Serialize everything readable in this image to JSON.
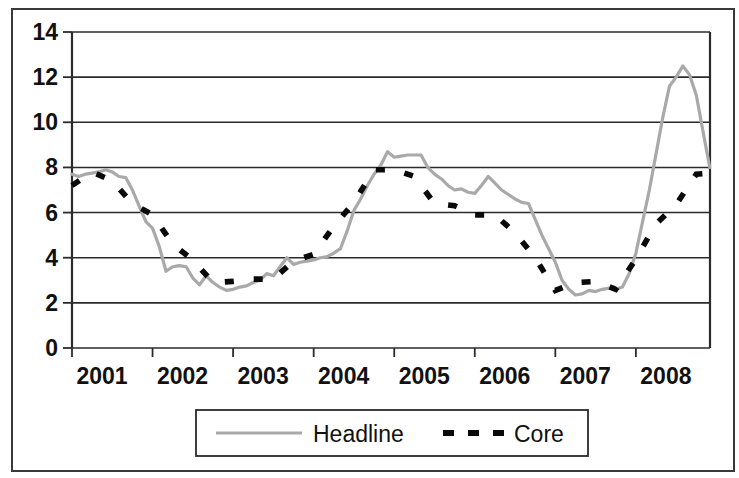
{
  "chart_data": {
    "type": "line",
    "title": "",
    "subtitle": "",
    "xlabel": "",
    "ylabel": "",
    "xlim": [
      2001,
      2008.92
    ],
    "ylim": [
      0,
      14
    ],
    "ytick_values": [
      0,
      2,
      4,
      6,
      8,
      10,
      12,
      14
    ],
    "ytick_labels": [
      "0",
      "2",
      "4",
      "6",
      "8",
      "10",
      "12",
      "14"
    ],
    "xtick_values": [
      2001,
      2002,
      2003,
      2004,
      2005,
      2006,
      2007,
      2008
    ],
    "xtick_labels": [
      "2001",
      "2002",
      "2003",
      "2004",
      "2005",
      "2006",
      "2007",
      "2008"
    ],
    "grid": "horizontal",
    "legend_position": "bottom-center",
    "colors": {
      "headline": "#a9a9a9",
      "core": "#0a0a0a",
      "axis": "#2b2b2b",
      "frame": "#3a3a3a",
      "background": "#ffffff"
    },
    "series": [
      {
        "name": "Headline",
        "style": "solid",
        "color": "#a9a9a9",
        "x": [
          2001.0,
          2001.083,
          2001.167,
          2001.25,
          2001.333,
          2001.417,
          2001.5,
          2001.583,
          2001.667,
          2001.75,
          2001.833,
          2001.917,
          2002.0,
          2002.083,
          2002.167,
          2002.25,
          2002.333,
          2002.417,
          2002.5,
          2002.583,
          2002.667,
          2002.75,
          2002.833,
          2002.917,
          2003.0,
          2003.083,
          2003.167,
          2003.25,
          2003.333,
          2003.417,
          2003.5,
          2003.583,
          2003.667,
          2003.75,
          2003.833,
          2003.917,
          2004.0,
          2004.083,
          2004.167,
          2004.25,
          2004.333,
          2004.417,
          2004.5,
          2004.583,
          2004.667,
          2004.75,
          2004.833,
          2004.917,
          2005.0,
          2005.083,
          2005.167,
          2005.25,
          2005.333,
          2005.417,
          2005.5,
          2005.583,
          2005.667,
          2005.75,
          2005.833,
          2005.917,
          2006.0,
          2006.083,
          2006.167,
          2006.25,
          2006.333,
          2006.417,
          2006.5,
          2006.583,
          2006.667,
          2006.75,
          2006.833,
          2006.917,
          2007.0,
          2007.083,
          2007.167,
          2007.25,
          2007.333,
          2007.417,
          2007.5,
          2007.583,
          2007.667,
          2007.75,
          2007.833,
          2007.917,
          2008.0,
          2008.083,
          2008.167,
          2008.25,
          2008.333,
          2008.417,
          2008.5,
          2008.583,
          2008.667,
          2008.75,
          2008.833,
          2008.917
        ],
        "values": [
          7.7,
          7.6,
          7.7,
          7.75,
          7.8,
          7.9,
          7.8,
          7.6,
          7.55,
          7.0,
          6.3,
          5.6,
          5.3,
          4.5,
          3.4,
          3.6,
          3.65,
          3.6,
          3.1,
          2.8,
          3.2,
          2.9,
          2.7,
          2.55,
          2.6,
          2.7,
          2.75,
          2.9,
          3.0,
          3.3,
          3.2,
          3.6,
          4.0,
          3.7,
          3.8,
          3.85,
          3.9,
          4.0,
          4.05,
          4.2,
          4.4,
          5.2,
          6.1,
          6.6,
          7.2,
          7.7,
          8.1,
          8.7,
          8.45,
          8.5,
          8.55,
          8.55,
          8.55,
          8.0,
          7.7,
          7.5,
          7.2,
          7.0,
          7.05,
          6.9,
          6.85,
          7.2,
          7.6,
          7.3,
          7.0,
          6.8,
          6.6,
          6.45,
          6.4,
          5.7,
          5.0,
          4.4,
          3.8,
          3.0,
          2.6,
          2.35,
          2.4,
          2.55,
          2.5,
          2.6,
          2.65,
          2.6,
          2.7,
          3.3,
          4.2,
          5.6,
          7.0,
          8.6,
          10.2,
          11.6,
          12.0,
          12.5,
          12.1,
          11.2,
          9.6,
          8.0
        ]
      },
      {
        "name": "Core",
        "style": "dashed",
        "color": "#0a0a0a",
        "x": [
          2001.0,
          2001.25,
          2001.5,
          2001.75,
          2002.0,
          2002.25,
          2002.5,
          2002.75,
          2003.0,
          2003.25,
          2003.5,
          2003.75,
          2004.0,
          2004.25,
          2004.5,
          2004.75,
          2005.0,
          2005.25,
          2005.5,
          2005.75,
          2006.0,
          2006.25,
          2006.5,
          2006.75,
          2007.0,
          2007.25,
          2007.5,
          2007.75,
          2008.0,
          2008.25,
          2008.5,
          2008.75,
          2008.92
        ],
        "values": [
          7.2,
          7.8,
          7.4,
          6.4,
          5.9,
          4.6,
          3.9,
          2.9,
          2.95,
          3.05,
          3.05,
          3.85,
          4.15,
          5.4,
          6.45,
          7.9,
          7.9,
          7.6,
          6.4,
          6.3,
          5.9,
          5.9,
          5.1,
          4.0,
          2.55,
          2.9,
          2.95,
          2.6,
          3.95,
          5.5,
          6.35,
          7.7,
          7.75
        ]
      }
    ],
    "annotations": {
      "peak_2008": 12.5,
      "trough_2003": 2.55,
      "trough_2007": 2.35,
      "peak_2005": 8.7,
      "start_2001": 7.7
    }
  },
  "legend": {
    "entries": [
      {
        "label": "Headline",
        "style": "solid",
        "color": "#a9a9a9"
      },
      {
        "label": "Core",
        "style": "dashed",
        "color": "#0a0a0a"
      }
    ],
    "headline_label": "Headline",
    "core_label": "Core"
  },
  "axes": {
    "y_labels": [
      "14",
      "12",
      "10",
      "8",
      "6",
      "4",
      "2",
      "0"
    ],
    "x_labels": [
      "2001",
      "2002",
      "2003",
      "2004",
      "2005",
      "2006",
      "2007",
      "2008"
    ]
  }
}
